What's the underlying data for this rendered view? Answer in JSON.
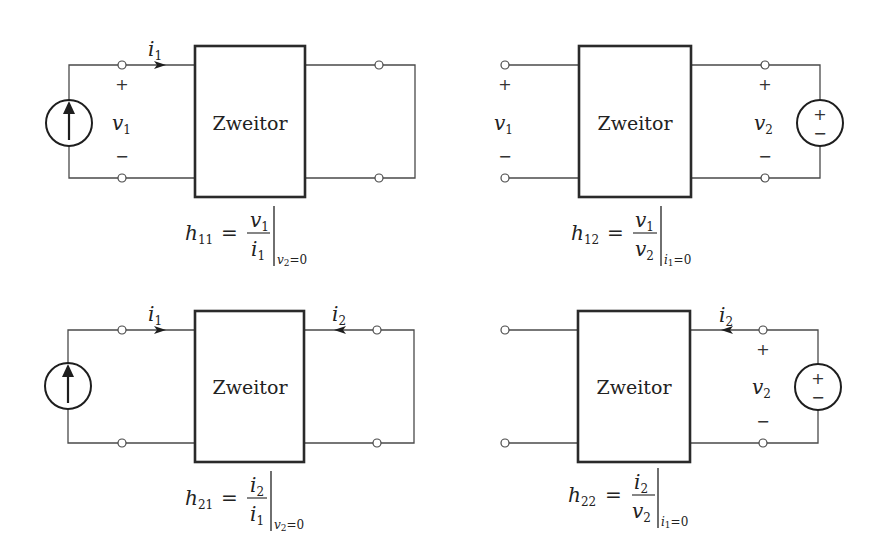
{
  "diagram": {
    "box_label": "Zweitor",
    "colors": {
      "line": "#4a4a4a",
      "box_border": "#2a2a2a",
      "text": "#222222",
      "background": "#ffffff"
    },
    "panels": [
      {
        "id": "h11",
        "position": "top-left",
        "source": {
          "type": "current-source",
          "side": "left",
          "icon": "current-source-up-arrow-icon"
        },
        "port1": {
          "current_label": "i",
          "current_sub": "1",
          "voltage_label": "v",
          "voltage_sub": "1",
          "plus": "+",
          "minus": "−"
        },
        "port2": {
          "shorted": true
        },
        "formula": {
          "lhs": "h",
          "lhs_sub": "11",
          "eq": "=",
          "num": "v",
          "num_sub": "1",
          "den": "i",
          "den_sub": "1",
          "cond_var": "v",
          "cond_sub": "2",
          "cond_rest": "=0"
        }
      },
      {
        "id": "h12",
        "position": "top-right",
        "source": {
          "type": "voltage-source",
          "side": "right",
          "icon": "voltage-source-plus-minus-icon",
          "plus": "+",
          "minus": "−"
        },
        "port1": {
          "voltage_label": "v",
          "voltage_sub": "1",
          "plus": "+",
          "minus": "−",
          "open": true
        },
        "port2": {
          "voltage_label": "v",
          "voltage_sub": "2",
          "plus": "+",
          "minus": "−"
        },
        "formula": {
          "lhs": "h",
          "lhs_sub": "12",
          "eq": "=",
          "num": "v",
          "num_sub": "1",
          "den": "v",
          "den_sub": "2",
          "cond_var": "i",
          "cond_sub": "1",
          "cond_rest": "=0"
        }
      },
      {
        "id": "h21",
        "position": "bottom-left",
        "source": {
          "type": "current-source",
          "side": "left",
          "icon": "current-source-up-arrow-icon"
        },
        "port1": {
          "current_label": "i",
          "current_sub": "1"
        },
        "port2": {
          "current_label": "i",
          "current_sub": "2",
          "shorted": true
        },
        "formula": {
          "lhs": "h",
          "lhs_sub": "21",
          "eq": "=",
          "num": "i",
          "num_sub": "2",
          "den": "i",
          "den_sub": "1",
          "cond_var": "v",
          "cond_sub": "2",
          "cond_rest": "=0"
        }
      },
      {
        "id": "h22",
        "position": "bottom-right",
        "source": {
          "type": "voltage-source",
          "side": "right",
          "icon": "voltage-source-plus-minus-icon",
          "plus": "+",
          "minus": "−"
        },
        "port1": {
          "open": true
        },
        "port2": {
          "current_label": "i",
          "current_sub": "2",
          "voltage_label": "v",
          "voltage_sub": "2",
          "plus": "+",
          "minus": "−"
        },
        "formula": {
          "lhs": "h",
          "lhs_sub": "22",
          "eq": "=",
          "num": "i",
          "num_sub": "2",
          "den": "v",
          "den_sub": "2",
          "cond_var": "i",
          "cond_sub": "1",
          "cond_rest": "=0"
        }
      }
    ]
  }
}
